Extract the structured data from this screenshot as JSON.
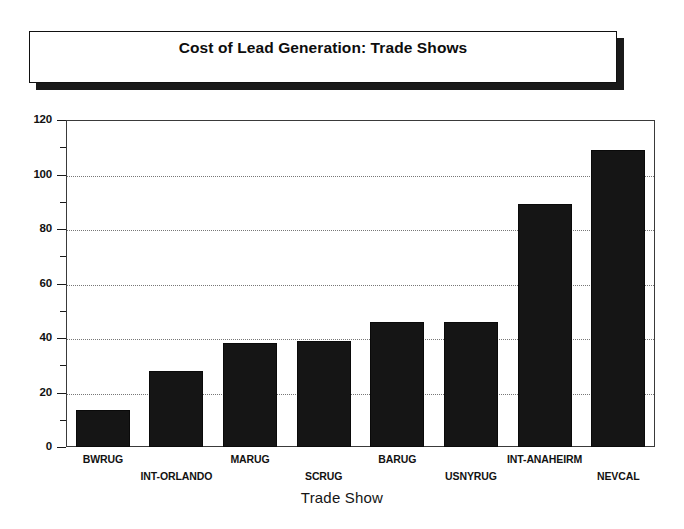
{
  "title": {
    "text": "Cost of Lead Generation: Trade Shows"
  },
  "chart_data": {
    "type": "bar",
    "title": "Cost of Lead Generation: Trade Shows",
    "xlabel": "Trade Show",
    "ylabel": "",
    "ylim": [
      0,
      120
    ],
    "ytick_labels": [
      "0",
      "20",
      "40",
      "60",
      "80",
      "100",
      "120"
    ],
    "ytick_values": [
      0,
      20,
      40,
      60,
      80,
      100,
      120
    ],
    "yminor_step": 10,
    "grid": "horizontal-dotted",
    "legend": "none",
    "bar_color": "#151515",
    "categories": [
      "BWRUG",
      "INT-ORLANDO",
      "MARUG",
      "SCRUG",
      "BARUG",
      "USNYRUG",
      "INT-ANAHEIRM",
      "NEVCAL"
    ],
    "values": [
      13.5,
      28,
      38,
      39,
      46,
      46,
      89,
      109
    ]
  }
}
